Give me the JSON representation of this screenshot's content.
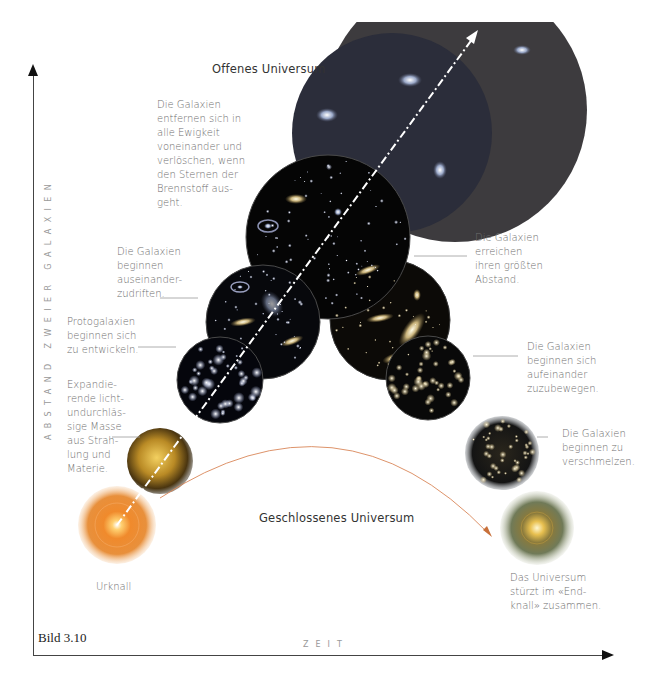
{
  "figure_label": "Bild 3.10",
  "axes": {
    "y_label": "ABSTAND ZWEIER GALAXIEN",
    "x_label": "ZEIT"
  },
  "titles": {
    "open": "Offenes Universum",
    "closed": "Geschlossenes Universum"
  },
  "annotations": {
    "open_end": "Die Galaxien\nentfernen sich in\nalle Ewigkeit\nvoneinander und\nverlöschen, wenn\nden Sternen der\nBrennstoff aus-\ngeht.",
    "drift_apart": "Die Galaxien\nbeginnen\nauseinander-\nzudriften.",
    "protogalaxies": "Protogalaxien\nbeginnen sich\nzu entwickeln.",
    "opaque_mass": "Expandie-\nrende licht-\nundurchläs-\nsige Masse\naus Strah-\nlung und\nMaterie.",
    "big_bang": "Urknall",
    "max_distance": "Die Galaxien\nerreichen\nihren größten\nAbstand.",
    "approach": "Die Galaxien\nbeginnen sich\naufeinander\nzuzubewegen.",
    "merge": "Die Galaxien\nbeginnen zu\nverschmelzen.",
    "big_crunch": "Das Universum\nstürzt im «End-\nknall» zusammen."
  },
  "stages": [
    {
      "name": "Urknall",
      "color": "#e8862a"
    },
    {
      "name": "Opaque mass",
      "color": "#b08a2a"
    },
    {
      "name": "Protogalaxies",
      "color": "#0a0a12"
    },
    {
      "name": "Drifting apart",
      "color": "#0b0b10"
    },
    {
      "name": "Expanding",
      "color": "#0a0a0a"
    },
    {
      "name": "Open - dim",
      "color": "#2c2e3a"
    },
    {
      "name": "Open - far",
      "color": "#3c3a3c"
    },
    {
      "name": "Max distance",
      "color": "#0d0b08"
    },
    {
      "name": "Approaching",
      "color": "#0a0a0a"
    },
    {
      "name": "Merging",
      "color": "#151515"
    },
    {
      "name": "Endknall",
      "color": "#d9b640"
    }
  ],
  "colors": {
    "axis": "#444444",
    "text_gray": "#6e6e6e",
    "curve_orange": "#d9875a",
    "arrow_white": "#ffffff"
  }
}
